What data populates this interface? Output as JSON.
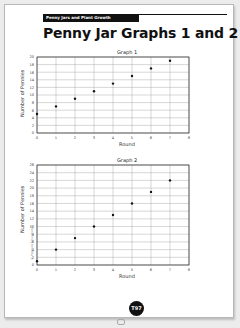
{
  "header": {
    "section_label": "Penny Jars and Plant Growth",
    "title": "Penny Jar Graphs 1 and 2"
  },
  "footer": {
    "page_number": "T97",
    "copyright": "© Pearson Education 4"
  },
  "chart_data": [
    {
      "type": "scatter",
      "title": "Graph 1",
      "xlabel": "Round",
      "ylabel": "Number of Pennies",
      "x_ticks": [
        0,
        1,
        2,
        3,
        4,
        5,
        6,
        7,
        8
      ],
      "y_ticks": [
        0,
        2,
        4,
        6,
        8,
        10,
        12,
        14,
        16,
        18,
        20
      ],
      "xlim": [
        0,
        8
      ],
      "ylim": [
        0,
        20
      ],
      "grid": true,
      "x": [
        0,
        1,
        2,
        3,
        4,
        5,
        6,
        7
      ],
      "y": [
        5,
        7,
        9,
        11,
        13,
        15,
        17,
        19
      ]
    },
    {
      "type": "scatter",
      "title": "Graph 2",
      "xlabel": "Round",
      "ylabel": "Number of Pennies",
      "x_ticks": [
        0,
        1,
        2,
        3,
        4,
        5,
        6,
        7,
        8
      ],
      "y_ticks": [
        0,
        2,
        4,
        6,
        8,
        10,
        12,
        14,
        16,
        18,
        20,
        22,
        24,
        26
      ],
      "xlim": [
        0,
        8
      ],
      "ylim": [
        0,
        26
      ],
      "grid": true,
      "x": [
        0,
        1,
        2,
        3,
        4,
        5,
        6,
        7
      ],
      "y": [
        1,
        4,
        7,
        10,
        13,
        16,
        19,
        22
      ]
    }
  ]
}
